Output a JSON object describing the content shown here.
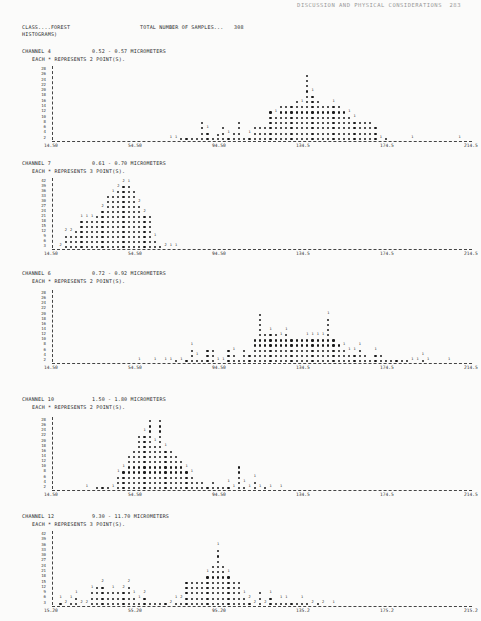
{
  "page": {
    "running_head": "DISCUSSION AND PHYSICAL CONSIDERATIONS  283"
  },
  "header": {
    "class_label": "CLASS....FOREST",
    "total_label": "TOTAL NUMBER OF SAMPLES...",
    "total_value": "308",
    "histograms_label": "HISTOGRAMS)"
  },
  "chart_data": [
    {
      "type": "bar",
      "title": "CHANNEL 4   0.52 - 0.57 MICROMETERS",
      "subtitle": "EACH * REPRESENTS 2 POINT(S).",
      "channel": "4",
      "range": "0.52 - 0.57 MICROMETERS",
      "points_per_star": 2,
      "ylabels": [
        "28",
        "26",
        "24",
        "22",
        "20",
        "18",
        "16",
        "14",
        "12",
        "10",
        "8",
        "6",
        "4",
        "2"
      ],
      "xticks": [
        "14.50",
        "54.50",
        "94.50",
        "134.5",
        "174.5",
        "214.5"
      ],
      "ylim": [
        0,
        28
      ],
      "x_range": [
        14.5,
        214.5
      ],
      "column_heights": [
        0,
        0,
        0,
        0,
        0,
        0,
        0,
        0,
        0,
        0,
        0,
        0,
        0,
        0,
        0,
        0,
        0,
        0,
        0,
        0,
        0,
        0,
        1,
        2,
        2,
        2,
        2,
        2,
        8,
        6,
        2,
        3,
        6,
        4,
        4,
        8,
        2,
        4,
        6,
        6,
        6,
        12,
        12,
        14,
        14,
        14,
        16,
        16,
        26,
        20,
        16,
        14,
        14,
        16,
        14,
        12,
        12,
        10,
        8,
        8,
        8,
        6,
        2,
        2,
        0,
        0,
        0,
        0,
        1,
        0,
        0,
        0,
        0,
        0,
        0,
        0,
        0,
        1,
        0,
        0,
        0
      ],
      "column_digits": [
        0,
        0,
        0,
        0,
        0,
        0,
        0,
        0,
        0,
        0,
        0,
        0,
        0,
        0,
        0,
        0,
        0,
        0,
        0,
        0,
        0,
        0,
        1,
        1,
        0,
        0,
        0,
        0,
        0,
        1,
        0,
        0,
        0,
        1,
        0,
        0,
        0,
        1,
        0,
        0,
        0,
        0,
        1,
        0,
        0,
        0,
        0,
        1,
        0,
        1,
        0,
        0,
        0,
        1,
        0,
        0,
        1,
        1,
        0,
        0,
        0,
        0,
        1,
        0,
        0,
        0,
        0,
        0,
        1,
        0,
        0,
        0,
        0,
        0,
        0,
        0,
        0,
        1,
        0,
        0,
        0
      ]
    },
    {
      "type": "bar",
      "title": "CHANNEL 7   0.61 - 0.70 MICROMETERS",
      "subtitle": "EACH * REPRESENTS 3 POINT(S).",
      "channel": "7",
      "range": "0.61 - 0.70 MICROMETERS",
      "points_per_star": 3,
      "ylabels": [
        "42",
        "39",
        "36",
        "33",
        "30",
        "27",
        "24",
        "21",
        "18",
        "15",
        "12",
        "9",
        "6",
        "3"
      ],
      "xticks": [
        "14.50",
        "54.50",
        "94.50",
        "134.5",
        "174.5",
        "214.5"
      ],
      "ylim": [
        0,
        42
      ],
      "x_range": [
        14.5,
        214.5
      ],
      "column_heights": [
        0,
        3,
        12,
        12,
        12,
        21,
        21,
        21,
        21,
        27,
        33,
        36,
        39,
        42,
        42,
        36,
        30,
        24,
        21,
        9,
        3,
        2,
        1,
        1,
        0,
        0,
        0,
        0,
        0,
        0,
        0,
        0,
        0,
        0,
        0,
        0,
        0,
        0,
        0,
        0,
        0,
        0,
        0,
        0,
        0,
        0,
        0,
        0,
        0,
        0,
        0,
        0,
        0,
        0,
        0,
        0,
        0,
        0,
        0,
        0,
        0,
        0,
        0,
        0,
        0,
        0,
        0,
        0,
        0,
        0,
        0,
        0,
        0,
        0,
        0,
        0,
        0,
        0,
        0,
        0,
        0
      ],
      "column_digits": [
        0,
        2,
        2,
        2,
        0,
        1,
        1,
        1,
        0,
        2,
        0,
        1,
        2,
        2,
        1,
        0,
        2,
        2,
        0,
        1,
        0,
        2,
        1,
        1,
        0,
        0,
        0,
        0,
        0,
        0,
        0,
        0,
        0,
        0,
        0,
        0,
        0,
        0,
        0,
        0,
        0,
        0,
        0,
        0,
        0,
        0,
        0,
        0,
        0,
        0,
        0,
        0,
        0,
        0,
        0,
        0,
        0,
        0,
        0,
        0,
        0,
        0,
        0,
        0,
        0,
        0,
        0,
        0,
        0,
        0,
        0,
        0,
        0,
        0,
        0,
        0,
        0,
        0,
        0,
        0,
        0
      ]
    },
    {
      "type": "bar",
      "title": "CHANNEL 6   0.72 - 0.92 MICROMETERS",
      "subtitle": "EACH * REPRESENTS 2 POINT(S).",
      "channel": "6",
      "range": "0.72 - 0.92 MICROMETERS",
      "points_per_star": 2,
      "ylabels": [
        "28",
        "26",
        "24",
        "22",
        "20",
        "18",
        "16",
        "14",
        "12",
        "10",
        "8",
        "6",
        "4",
        "2"
      ],
      "xticks": [
        "14.50",
        "54.50",
        "94.50",
        "134.5",
        "174.5",
        "214.5"
      ],
      "ylim": [
        0,
        28
      ],
      "x_range": [
        14.5,
        214.5
      ],
      "column_heights": [
        0,
        0,
        0,
        0,
        0,
        0,
        0,
        0,
        0,
        0,
        0,
        0,
        0,
        0,
        0,
        0,
        1,
        0,
        0,
        1,
        0,
        1,
        1,
        2,
        1,
        2,
        8,
        4,
        2,
        6,
        6,
        2,
        2,
        6,
        6,
        2,
        6,
        4,
        10,
        20,
        12,
        14,
        12,
        12,
        14,
        10,
        10,
        10,
        12,
        12,
        12,
        12,
        20,
        10,
        8,
        8,
        6,
        6,
        8,
        4,
        2,
        6,
        4,
        2,
        2,
        2,
        2,
        2,
        2,
        1,
        4,
        2,
        0,
        0,
        0,
        1,
        0,
        0,
        0,
        0,
        0
      ],
      "column_digits": [
        0,
        0,
        0,
        0,
        0,
        0,
        0,
        0,
        0,
        0,
        0,
        0,
        0,
        0,
        0,
        0,
        1,
        0,
        0,
        1,
        0,
        1,
        1,
        0,
        1,
        0,
        1,
        1,
        0,
        0,
        0,
        1,
        1,
        0,
        1,
        0,
        0,
        0,
        0,
        0,
        0,
        1,
        0,
        1,
        1,
        0,
        0,
        0,
        1,
        1,
        1,
        1,
        1,
        0,
        0,
        1,
        1,
        1,
        1,
        0,
        0,
        1,
        0,
        0,
        0,
        0,
        0,
        0,
        1,
        1,
        1,
        1,
        0,
        0,
        0,
        1,
        0,
        0,
        0,
        0,
        0
      ]
    },
    {
      "type": "bar",
      "title": "CHANNEL 10   1.50 - 1.80 MICROMETERS",
      "subtitle": "EACH * REPRESENTS 2 POINT(S).",
      "channel": "10",
      "range": "1.50 - 1.80 MICROMETERS",
      "points_per_star": 2,
      "ylabels": [
        "28",
        "26",
        "24",
        "22",
        "20",
        "18",
        "16",
        "14",
        "12",
        "10",
        "8",
        "6",
        "4",
        "2"
      ],
      "xticks": [
        "14.50",
        "54.50",
        "94.50",
        "134.5",
        "174.5",
        "214.5"
      ],
      "ylim": [
        0,
        28
      ],
      "x_range": [
        14.5,
        214.5
      ],
      "column_heights": [
        0,
        0,
        0,
        0,
        0,
        0,
        1,
        0,
        2,
        2,
        2,
        2,
        8,
        10,
        14,
        16,
        22,
        24,
        28,
        20,
        28,
        18,
        16,
        14,
        12,
        10,
        8,
        4,
        4,
        2,
        4,
        2,
        2,
        4,
        2,
        10,
        4,
        2,
        6,
        2,
        2,
        1,
        0,
        1,
        0,
        0,
        0,
        0,
        0,
        0,
        0,
        0,
        0,
        0,
        0,
        0,
        0,
        0,
        0,
        0,
        0,
        0,
        0,
        0,
        0,
        0,
        0,
        0,
        0,
        0,
        0,
        0,
        0,
        0,
        0,
        0,
        0,
        0,
        0,
        0,
        0
      ],
      "column_digits": [
        0,
        0,
        0,
        0,
        0,
        0,
        1,
        0,
        0,
        0,
        0,
        1,
        1,
        1,
        0,
        0,
        0,
        1,
        0,
        1,
        0,
        1,
        0,
        0,
        0,
        1,
        1,
        0,
        0,
        0,
        0,
        0,
        0,
        1,
        1,
        0,
        1,
        1,
        1,
        1,
        0,
        1,
        0,
        1,
        0,
        0,
        0,
        0,
        0,
        0,
        0,
        0,
        0,
        0,
        0,
        0,
        0,
        0,
        0,
        0,
        0,
        0,
        0,
        0,
        0,
        0,
        0,
        0,
        0,
        0,
        0,
        0,
        0,
        0,
        0,
        0,
        0,
        0,
        0,
        0,
        0
      ]
    },
    {
      "type": "bar",
      "title": "CHANNEL 12   9.30 - 11.70 MICROMETERS",
      "subtitle": "EACH * REPRESENTS 3 POINT(S).",
      "channel": "12",
      "range": "9.30 - 11.70 MICROMETERS",
      "points_per_star": 3,
      "ylabels": [
        "42",
        "39",
        "36",
        "33",
        "30",
        "27",
        "24",
        "21",
        "18",
        "15",
        "12",
        "9",
        "6",
        "3"
      ],
      "xticks": [
        "15.20",
        "55.20",
        "95.20",
        "135.2",
        "175.2",
        "215.2"
      ],
      "ylim": [
        0,
        42
      ],
      "x_range": [
        15.2,
        215.2
      ],
      "column_heights": [
        0,
        6,
        3,
        6,
        9,
        3,
        3,
        12,
        12,
        15,
        9,
        12,
        9,
        12,
        15,
        9,
        6,
        9,
        3,
        3,
        3,
        3,
        3,
        6,
        6,
        15,
        15,
        15,
        15,
        21,
        24,
        36,
        24,
        21,
        15,
        15,
        9,
        6,
        3,
        9,
        3,
        9,
        3,
        6,
        6,
        3,
        3,
        6,
        3,
        2,
        3,
        2,
        0,
        1,
        0,
        0,
        0,
        0,
        0,
        0,
        0,
        0,
        0,
        0,
        0,
        0,
        0,
        0,
        0,
        0,
        0,
        0,
        0,
        0,
        0,
        0,
        0,
        0,
        0,
        0,
        0
      ],
      "column_digits": [
        0,
        1,
        2,
        1,
        1,
        2,
        2,
        1,
        0,
        2,
        0,
        1,
        0,
        2,
        2,
        1,
        1,
        2,
        0,
        0,
        0,
        0,
        2,
        1,
        2,
        0,
        0,
        0,
        0,
        1,
        0,
        1,
        0,
        1,
        0,
        0,
        1,
        2,
        2,
        0,
        2,
        1,
        0,
        1,
        1,
        0,
        0,
        1,
        0,
        2,
        0,
        2,
        0,
        1,
        0,
        0,
        0,
        0,
        0,
        0,
        0,
        0,
        0,
        0,
        0,
        0,
        0,
        0,
        0,
        0,
        0,
        0,
        0,
        0,
        0,
        0,
        0,
        0,
        0,
        0,
        0
      ]
    }
  ],
  "layout": [
    {
      "title_top": 48,
      "sub_top": 56,
      "plot_top": 66,
      "plot_height": 74
    },
    {
      "title_top": 160,
      "sub_top": 168,
      "plot_top": 178,
      "plot_height": 70
    },
    {
      "title_top": 270,
      "sub_top": 278,
      "plot_top": 290,
      "plot_height": 72
    },
    {
      "title_top": 396,
      "sub_top": 404,
      "plot_top": 417,
      "plot_height": 72
    },
    {
      "title_top": 513,
      "sub_top": 521,
      "plot_top": 531,
      "plot_height": 74
    }
  ]
}
